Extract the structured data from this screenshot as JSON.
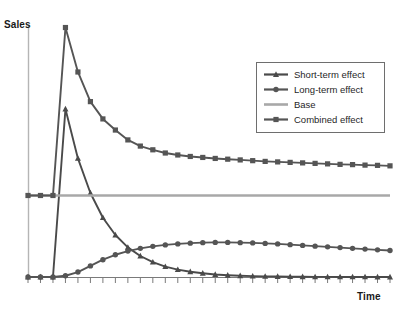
{
  "chart_data": {
    "type": "line",
    "title": "",
    "xlabel": "Time",
    "ylabel": "Sales",
    "grid": false,
    "legend_position": "top-right",
    "x": [
      0,
      1,
      2,
      3,
      4,
      5,
      6,
      7,
      8,
      9,
      10,
      11,
      12,
      13,
      14,
      15,
      16,
      17,
      18,
      19,
      20,
      21,
      22,
      23,
      24,
      25,
      26,
      27,
      28,
      29
    ],
    "xlim": [
      0,
      29
    ],
    "ylim": [
      0,
      100
    ],
    "axis_tick_count": 30,
    "series": [
      {
        "name": "Short-term effect",
        "marker": "triangle",
        "color": "#4a4a4a",
        "values": [
          0,
          0,
          0,
          68,
          48,
          34,
          24,
          17,
          12,
          8.5,
          6,
          4.2,
          3,
          2.1,
          1.5,
          1.0,
          0.7,
          0.5,
          0.35,
          0.25,
          0.18,
          0.12,
          0.09,
          0.06,
          0.04,
          0.03,
          0.02,
          0.015,
          0.01,
          0.01
        ]
      },
      {
        "name": "Long-term effect",
        "marker": "circle",
        "color": "#555555",
        "values": [
          0,
          0,
          0,
          0.5,
          2,
          4.5,
          7,
          9,
          10.5,
          11.6,
          12.4,
          13,
          13.4,
          13.7,
          13.9,
          14,
          14,
          13.9,
          13.8,
          13.6,
          13.4,
          13.1,
          12.8,
          12.5,
          12.2,
          11.9,
          11.6,
          11.3,
          11.0,
          10.7
        ]
      },
      {
        "name": "Base",
        "marker": "none",
        "color": "#a8a8a8",
        "values": [
          33,
          33,
          33,
          33,
          33,
          33,
          33,
          33,
          33,
          33,
          33,
          33,
          33,
          33,
          33,
          33,
          33,
          33,
          33,
          33,
          33,
          33,
          33,
          33,
          33,
          33,
          33,
          33,
          33,
          33
        ]
      },
      {
        "name": "Combined effect",
        "marker": "square",
        "color": "#555555",
        "values": [
          33,
          33,
          33,
          101,
          83,
          71,
          64,
          59.5,
          55.5,
          53,
          51.5,
          50.2,
          49.4,
          48.8,
          48.4,
          48,
          47.7,
          47.4,
          47.1,
          46.8,
          46.6,
          46.4,
          46.2,
          46.0,
          45.8,
          45.6,
          45.5,
          45.3,
          45.2,
          45.0
        ]
      }
    ]
  },
  "legend": {
    "items": [
      {
        "label": "Short-term effect",
        "marker": "triangle",
        "color": "#4a4a4a"
      },
      {
        "label": "Long-term effect",
        "marker": "circle",
        "color": "#555555"
      },
      {
        "label": "Base",
        "marker": "none",
        "color": "#a8a8a8"
      },
      {
        "label": "Combined effect",
        "marker": "square",
        "color": "#555555"
      }
    ]
  },
  "axes": {
    "y_title": "Sales",
    "x_title": "Time"
  },
  "colors": {
    "axis": "#b5b5b5",
    "tick": "#7a7a7a",
    "base": "#a8a8a8",
    "dark_line": "#555555",
    "short_term": "#4a4a4a",
    "legend_border": "#6e6e6e",
    "text": "#1a1a1a",
    "background": "#ffffff"
  }
}
